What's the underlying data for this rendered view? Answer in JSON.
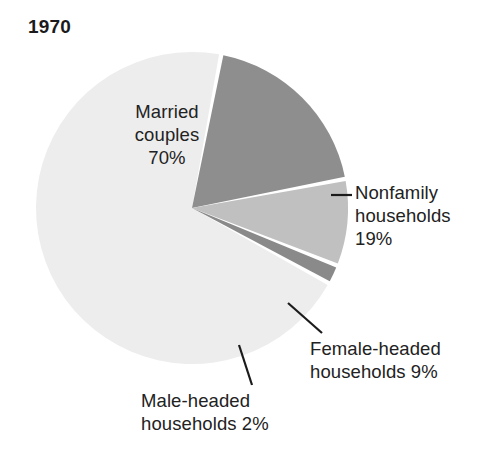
{
  "chart_data": {
    "type": "pie",
    "title": "1970",
    "xlabel": "",
    "ylabel": "",
    "legend_position": "none",
    "grid": false,
    "units": "percent",
    "total": 100,
    "categories": [
      "Married couples",
      "Nonfamily households",
      "Female-headed households",
      "Male-headed households"
    ],
    "values": [
      70,
      19,
      9,
      2
    ],
    "slices": [
      {
        "name": "Married couples",
        "label_line1": "Married",
        "label_line2": "couples",
        "value_label": "70%",
        "value": 70,
        "color": "#ededed",
        "label_placement": "inside",
        "leader_line": false
      },
      {
        "name": "Nonfamily households",
        "label_line1": "Nonfamily",
        "label_line2": "households",
        "value_label": "19%",
        "value": 19,
        "color": "#8e8e8e",
        "label_placement": "outside-right",
        "leader_line": true
      },
      {
        "name": "Female-headed households",
        "label_line1": "Female-headed",
        "label_line2": "households 9%",
        "value_label": "9%",
        "value": 9,
        "color": "#c0c0c0",
        "label_placement": "outside-bottom-right",
        "leader_line": true
      },
      {
        "name": "Male-headed households",
        "label_line1": "Male-headed",
        "label_line2": "households 2%",
        "value_label": "2%",
        "value": 2,
        "color": "#8a8a8a",
        "label_placement": "outside-bottom",
        "leader_line": true
      }
    ],
    "labels": {
      "married_text": "Married\ncouples\n70%",
      "nonfamily_text": "Nonfamily\nhouseholds\n19%",
      "female_text": "Female-headed\nhouseholds 9%",
      "male_text": "Male-headed\nhouseholds 2%"
    },
    "colors": {
      "background": "#ffffff",
      "separator": "#ffffff",
      "text": "#222222",
      "title": "#1b1b1b",
      "leader_line": "#1b1b1b"
    }
  }
}
